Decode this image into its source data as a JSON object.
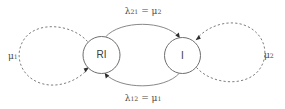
{
  "diagram": {
    "type": "state-transition-diagram",
    "background_color": "#ffffff",
    "stroke_color": "#6e6e6e",
    "arrow_color": "#2e2e2e",
    "text_color": "#4a4a4a",
    "nodes": [
      {
        "id": "RI",
        "label": "RI",
        "cx": 101.5,
        "cy": 55,
        "r": 18.5
      },
      {
        "id": "I",
        "label": "I",
        "cx": 182.5,
        "cy": 55.5,
        "r": 18.0
      }
    ],
    "transitions": [
      {
        "id": "top",
        "from": "RI",
        "to": "I",
        "style": "solid",
        "label_lambda": "λ",
        "label_lambda_sub": "21",
        "label_equals": " = ",
        "label_mu": "μ",
        "label_mu_sub": "2",
        "label_full": "λ21 = μ2"
      },
      {
        "id": "bottom",
        "from": "I",
        "to": "RI",
        "style": "solid",
        "label_lambda": "λ",
        "label_lambda_sub": "12",
        "label_equals": " = ",
        "label_mu": "μ",
        "label_mu_sub": "1",
        "label_full": "λ12 = μ1"
      }
    ],
    "self_loops": [
      {
        "id": "left",
        "node": "RI",
        "style": "dashed",
        "label_mu": "μ",
        "label_mu_sub": "1",
        "label_full": "μ1"
      },
      {
        "id": "right",
        "node": "I",
        "style": "dashed",
        "label_mu": "μ",
        "label_mu_sub": "2",
        "label_full": "μ2"
      }
    ]
  }
}
